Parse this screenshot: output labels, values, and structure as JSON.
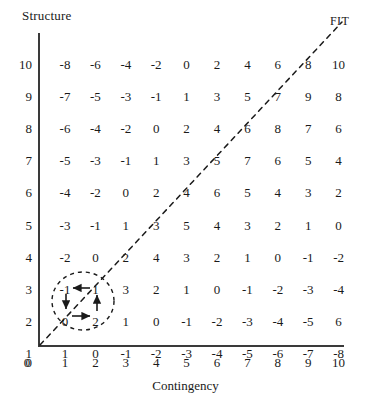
{
  "figure": {
    "y_axis_title": "Structure",
    "x_axis_title": "Contingency",
    "fit_label": "FIT"
  },
  "annotation": {
    "circle_note": "cycle-highlight",
    "arrows": [
      "left",
      "down",
      "right",
      "up"
    ]
  },
  "chart_data": {
    "type": "table",
    "title": "",
    "xlabel": "Contingency",
    "ylabel": "Structure",
    "xlim": [
      0,
      10
    ],
    "ylim": [
      0,
      10
    ],
    "grid": false,
    "legend": [
      "FIT"
    ],
    "annotations": [
      {
        "text": "FIT",
        "position": "top-right",
        "style": "dashed-diagonal-line"
      },
      {
        "text": "cycle",
        "position": "contingency 1-2, structure 1-2",
        "style": "dashed-ellipse-with-arrows"
      }
    ],
    "x_ticks": [
      "0",
      "1",
      "2",
      "3",
      "4",
      "5",
      "6",
      "7",
      "8",
      "9",
      "10"
    ],
    "y_ticks": [
      "10",
      "9",
      "8",
      "7",
      "6",
      "5",
      "4",
      "3",
      "2",
      "1",
      "0"
    ],
    "columns": [
      "1",
      "2",
      "3",
      "4",
      "5",
      "6",
      "7",
      "8",
      "9",
      "10"
    ],
    "rows": [
      {
        "structure": "10",
        "values": [
          "-8",
          "-6",
          "-4",
          "-2",
          "0",
          "2",
          "4",
          "6",
          "8",
          "10"
        ]
      },
      {
        "structure": "9",
        "values": [
          "-7",
          "-5",
          "-3",
          "-1",
          "1",
          "3",
          "5",
          "7",
          "9",
          "8"
        ]
      },
      {
        "structure": "8",
        "values": [
          "-6",
          "-4",
          "-2",
          "0",
          "2",
          "4",
          "6",
          "8",
          "7",
          "6"
        ]
      },
      {
        "structure": "7",
        "values": [
          "-5",
          "-3",
          "-1",
          "1",
          "3",
          "5",
          "7",
          "6",
          "5",
          "4"
        ]
      },
      {
        "structure": "6",
        "values": [
          "-4",
          "-2",
          "0",
          "2",
          "4",
          "6",
          "5",
          "4",
          "3",
          "2"
        ]
      },
      {
        "structure": "5",
        "values": [
          "-3",
          "-1",
          "1",
          "3",
          "5",
          "4",
          "3",
          "2",
          "1",
          "0"
        ]
      },
      {
        "structure": "4",
        "values": [
          "-2",
          "0",
          "2",
          "4",
          "3",
          "2",
          "1",
          "0",
          "-1",
          "-2"
        ]
      },
      {
        "structure": "3",
        "values": [
          "-1",
          "1",
          "3",
          "2",
          "1",
          "0",
          "-1",
          "-2",
          "-3",
          "-4"
        ]
      },
      {
        "structure": "2",
        "values": [
          "0",
          "2",
          "1",
          "0",
          "-1",
          "-2",
          "-3",
          "-4",
          "-5",
          "6"
        ]
      },
      {
        "structure": "1",
        "values": [
          "1",
          "0",
          "-1",
          "-2",
          "-3",
          "-4",
          "-5",
          "-6",
          "-7",
          "-8"
        ]
      }
    ]
  }
}
